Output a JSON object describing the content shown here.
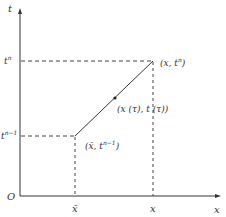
{
  "diagram": {
    "axes": {
      "y_label": "t",
      "x_label": "x",
      "origin_label": "O"
    },
    "y_ticks": [
      {
        "base": "t",
        "sup": "n"
      },
      {
        "base": "t",
        "sup": "n−1"
      }
    ],
    "x_ticks": [
      {
        "label": "x̄"
      },
      {
        "label": "x"
      }
    ],
    "points": {
      "start": {
        "label_prefix": "(x̄, t",
        "sup": "n−1",
        "suffix": ")"
      },
      "end": {
        "label_prefix": "(x, t",
        "sup": "n",
        "suffix": ")"
      },
      "mid": {
        "label": "(x (τ), t (τ))"
      }
    },
    "colors": {
      "line": "#333333",
      "dash": "#444444"
    }
  }
}
